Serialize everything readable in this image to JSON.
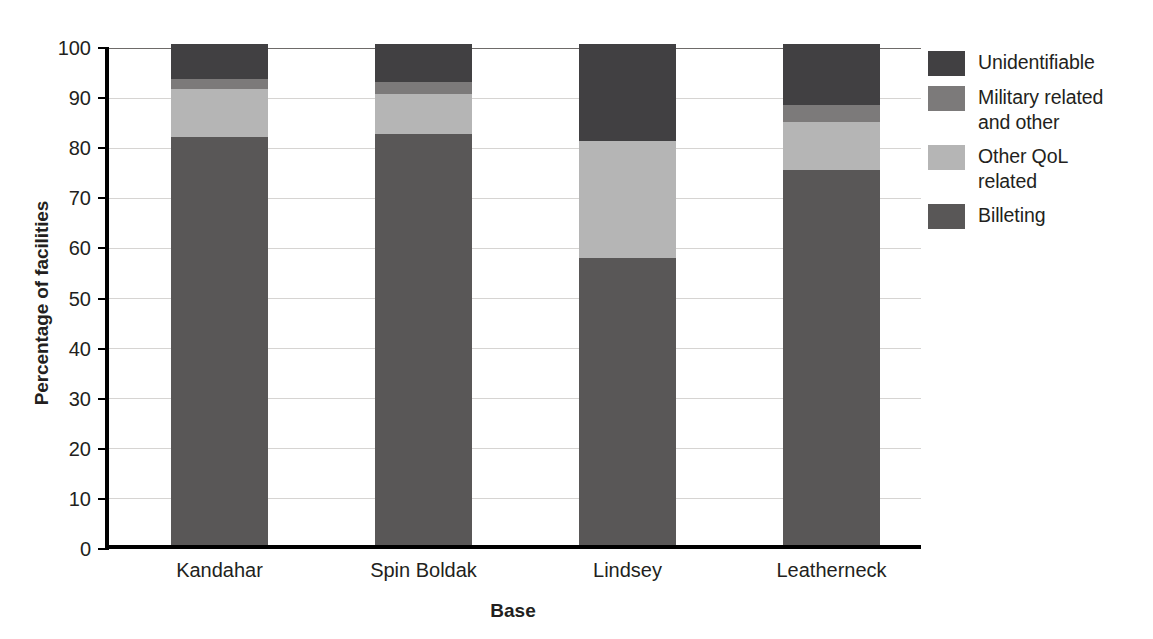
{
  "chart_data": {
    "type": "bar",
    "subtype": "stacked-bar-100",
    "title": "",
    "xlabel": "Base",
    "ylabel": "Percentage of facilities",
    "categories": [
      "Kandahar",
      "Spin Boldak",
      "Lindsey",
      "Leatherneck"
    ],
    "ylim": [
      0,
      100
    ],
    "yticks": [
      0,
      10,
      20,
      30,
      40,
      50,
      60,
      70,
      80,
      90,
      100
    ],
    "ytick_labels": [
      "0",
      "10",
      "20",
      "30",
      "40",
      "50",
      "60",
      "70",
      "80",
      "90",
      "100"
    ],
    "grid": true,
    "legend_position": "right",
    "stack_order_bottom_to_top": [
      "Billeting",
      "Other QoL related",
      "Military related and other",
      "Unidentifiable"
    ],
    "series": [
      {
        "name": "Billeting",
        "color": "#595757",
        "values": [
          81.5,
          82.0,
          57.2,
          74.8
        ]
      },
      {
        "name": "Other QoL related",
        "color": "#b5b5b5",
        "values": [
          9.5,
          8.0,
          23.5,
          9.7
        ]
      },
      {
        "name": "Military related and other",
        "color": "#7c7a7a",
        "values": [
          2.0,
          2.5,
          0.0,
          3.3
        ]
      },
      {
        "name": "Unidentifiable",
        "color": "#414042",
        "values": [
          7.0,
          7.5,
          19.3,
          12.2
        ]
      }
    ]
  },
  "legend": {
    "entries": [
      {
        "label": "Unidentifiable",
        "color": "#414042"
      },
      {
        "label": "Military related\nand other",
        "color": "#7c7a7a"
      },
      {
        "label": "Other QoL\nrelated",
        "color": "#b5b5b5"
      },
      {
        "label": "Billeting",
        "color": "#595757"
      }
    ]
  },
  "axes": {
    "y_title": "Percentage of facilities",
    "x_title": "Base"
  }
}
